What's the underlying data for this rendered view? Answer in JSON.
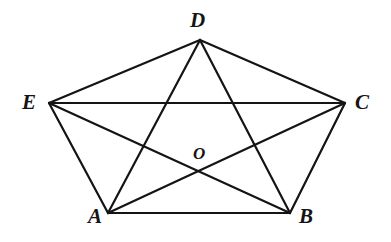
{
  "figure": {
    "type": "geometric-diagram",
    "background_color": "#ffffff",
    "stroke_color": "#141414",
    "stroke_width": 2.2,
    "canvas": {
      "width": 391,
      "height": 242
    },
    "points": [
      {
        "id": "A",
        "label": "A",
        "x": 108,
        "y": 213,
        "label_x": 88,
        "label_y": 206,
        "size": "size-main"
      },
      {
        "id": "B",
        "label": "B",
        "x": 290,
        "y": 213,
        "label_x": 299,
        "label_y": 206,
        "size": "size-main"
      },
      {
        "id": "C",
        "label": "C",
        "x": 345,
        "y": 103,
        "label_x": 355,
        "label_y": 92,
        "size": "size-main"
      },
      {
        "id": "D",
        "label": "D",
        "x": 200,
        "y": 40,
        "label_x": 190,
        "label_y": 10,
        "size": "size-main"
      },
      {
        "id": "E",
        "label": "E",
        "x": 49,
        "y": 103,
        "label_x": 22,
        "label_y": 92,
        "size": "size-main"
      },
      {
        "id": "O",
        "label": "O",
        "x": 202,
        "y": 174,
        "label_x": 193,
        "label_y": 145,
        "size": "size-center"
      }
    ],
    "edges": [
      {
        "id": "AB",
        "from": "A",
        "to": "B",
        "kind": "side"
      },
      {
        "id": "BC",
        "from": "B",
        "to": "C",
        "kind": "side"
      },
      {
        "id": "CD",
        "from": "C",
        "to": "D",
        "kind": "side"
      },
      {
        "id": "DE",
        "from": "D",
        "to": "E",
        "kind": "side"
      },
      {
        "id": "EA",
        "from": "E",
        "to": "A",
        "kind": "side"
      },
      {
        "id": "AC",
        "from": "A",
        "to": "C",
        "kind": "diagonal"
      },
      {
        "id": "AD",
        "from": "A",
        "to": "D",
        "kind": "diagonal"
      },
      {
        "id": "BD",
        "from": "B",
        "to": "D",
        "kind": "diagonal"
      },
      {
        "id": "BE",
        "from": "B",
        "to": "E",
        "kind": "diagonal"
      },
      {
        "id": "CE",
        "from": "C",
        "to": "E",
        "kind": "diagonal"
      }
    ]
  }
}
